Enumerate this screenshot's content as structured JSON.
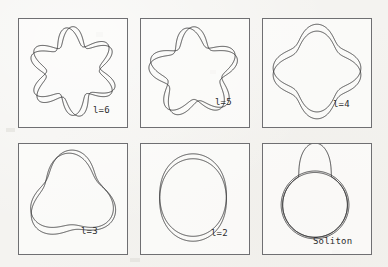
{
  "figure": {
    "background_color": "#f3f2ef",
    "ink_color": "#2b2b2d",
    "border_color": "#6f6f72",
    "panel_fill": "#fcfcfb"
  },
  "layout": {
    "columns": 3,
    "rows": 2,
    "panel_width": 110,
    "panel_height": 110,
    "col_x": [
      18,
      140,
      262
    ],
    "row_y": [
      18,
      143
    ],
    "bottom_panel_height": 112
  },
  "chart_data": {
    "type": "line",
    "title": "",
    "xlabel": "",
    "ylabel": "",
    "panels": [
      {
        "id": "panel-l6",
        "label": "l=6",
        "label_x": 74,
        "label_y": 86,
        "mode": "multipole",
        "l": 6,
        "curves": [
          {
            "name": "curve-a",
            "base_radius": 36,
            "amplitude": 0.255,
            "phase_deg": 90,
            "rotation_deg": 0,
            "cx": 55,
            "cy": 53
          },
          {
            "name": "curve-b",
            "base_radius": 36.5,
            "amplitude": 0.245,
            "phase_deg": 90,
            "rotation_deg": 9,
            "cx": 55,
            "cy": 54
          }
        ]
      },
      {
        "id": "panel-l5",
        "label": "l=5",
        "label_x": 74,
        "label_y": 78,
        "mode": "multipole",
        "l": 5,
        "curves": [
          {
            "name": "curve-a",
            "base_radius": 37,
            "amplitude": 0.245,
            "phase_deg": 90,
            "rotation_deg": 0,
            "cx": 54,
            "cy": 54
          },
          {
            "name": "curve-b",
            "base_radius": 37.5,
            "amplitude": 0.235,
            "phase_deg": 90,
            "rotation_deg": 10,
            "cx": 54,
            "cy": 55
          }
        ]
      },
      {
        "id": "panel-l4",
        "label": "l=4",
        "label_x": 70,
        "label_y": 80,
        "mode": "multipole",
        "l": 4,
        "curves": [
          {
            "name": "curve-a",
            "base_radius": 38,
            "amplitude": 0.175,
            "phase_deg": 90,
            "rotation_deg": 0,
            "cx": 55,
            "cy": 50
          },
          {
            "name": "curve-b",
            "base_radius": 38,
            "amplitude": 0.175,
            "phase_deg": 90,
            "rotation_deg": 0,
            "cx": 55,
            "cy": 57
          }
        ]
      },
      {
        "id": "panel-l3",
        "label": "l=3",
        "label_x": 62,
        "label_y": 82,
        "mode": "multipole",
        "l": 3,
        "curves": [
          {
            "name": "curve-a",
            "base_radius": 38,
            "amplitude": 0.205,
            "phase_deg": 90,
            "rotation_deg": 0,
            "cx": 54,
            "cy": 52
          },
          {
            "name": "curve-b",
            "base_radius": 39,
            "amplitude": 0.2,
            "phase_deg": 90,
            "rotation_deg": 6,
            "cx": 54,
            "cy": 56
          }
        ]
      },
      {
        "id": "panel-l2",
        "label": "l=2",
        "label_x": 70,
        "label_y": 84,
        "mode": "multipole",
        "l": 2,
        "curves": [
          {
            "name": "curve-a",
            "base_radius": 38,
            "amplitude": 0.105,
            "phase_deg": 90,
            "rotation_deg": 0,
            "cx": 53,
            "cy": 52
          },
          {
            "name": "curve-b",
            "base_radius": 38,
            "amplitude": 0.105,
            "phase_deg": 90,
            "rotation_deg": 0,
            "cx": 53,
            "cy": 57
          }
        ]
      },
      {
        "id": "panel-soliton",
        "label": "Soliton",
        "label_x": 50,
        "label_y": 92,
        "mode": "soliton",
        "l": null,
        "curves": [
          {
            "name": "circle-a",
            "base_radius": 33,
            "cx": 53,
            "cy": 62
          },
          {
            "name": "circle-b",
            "base_radius": 34.5,
            "cx": 53,
            "cy": 62
          },
          {
            "name": "bump",
            "peak_height": 30,
            "width_deg": 62,
            "cx": 53,
            "cy": 62,
            "base_radius": 33
          }
        ]
      }
    ]
  }
}
